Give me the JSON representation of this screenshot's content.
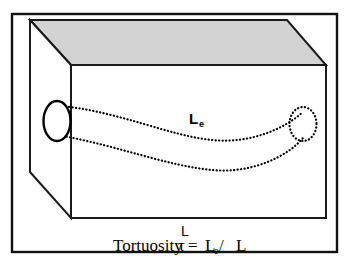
{
  "figure": {
    "kind": "schematic-diagram",
    "background_color": "#ffffff",
    "frame": {
      "name": "outer-border",
      "stroke_color": "#111111"
    }
  },
  "box": {
    "name": "porous-medium-block",
    "top_face_fill": "#d2d2d2",
    "side_face_fill": "#ffffff",
    "front_face_fill": "#ffffff",
    "edge_color": "#1a1a1a"
  },
  "pore": {
    "inlet_label": "pore-inlet-opening",
    "outlet_label": "pore-outlet-opening",
    "channel_label": "tortuous-pore-channel",
    "stroke_color": "#000000",
    "style": "dotted"
  },
  "labels": {
    "effective_length": "L",
    "effective_length_subscript": "e",
    "straight_length": "L"
  },
  "caption": {
    "prefix": "Tortuosity ",
    "tau": "τ",
    "equals": " = ",
    "numerator": "L",
    "numerator_subscript": "e",
    "divider": " / ",
    "denominator": "L",
    "full_text": "Tortuosity τ = Le / L"
  }
}
